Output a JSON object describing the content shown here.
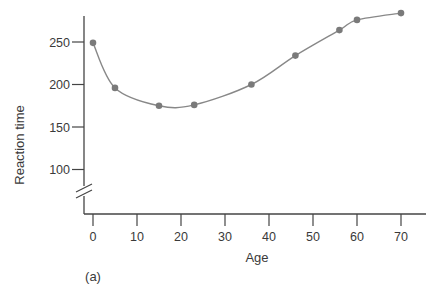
{
  "chart_data": {
    "type": "line",
    "title": "",
    "xlabel": "Age",
    "ylabel": "Reaction time",
    "panel_label": "(a)",
    "x": [
      0,
      5,
      15,
      23,
      36,
      46,
      56,
      60,
      70
    ],
    "series": [
      {
        "name": "Reaction time",
        "values": [
          249,
          196,
          175,
          176,
          200,
          234,
          264,
          276,
          284
        ],
        "marker": "circle",
        "smooth": true
      }
    ],
    "xticks": [
      0,
      10,
      20,
      30,
      40,
      50,
      60,
      70
    ],
    "xtick_labels": [
      "0",
      "10",
      "20",
      "30",
      "40",
      "50",
      "60",
      "70"
    ],
    "yticks": [
      100,
      150,
      200,
      250
    ],
    "ytick_labels": [
      "100",
      "150",
      "200",
      "250"
    ],
    "xlim": [
      0,
      75
    ],
    "ylim": [
      100,
      290
    ],
    "y_axis_break": true,
    "grid": false,
    "legend": null,
    "colors": {
      "axis": "#444444",
      "line": "#888888",
      "marker": "#7a7a7a",
      "text": "#3a3a3a"
    }
  }
}
